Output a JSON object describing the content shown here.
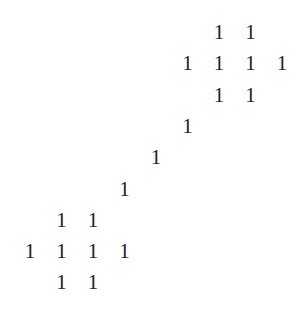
{
  "matrix": {
    "grid": {
      "cols": 9,
      "rows": 9,
      "x0": 30,
      "y0": 33,
      "dx": 31.5,
      "dy": 31.3
    },
    "text_color": "#222222",
    "entries": [
      {
        "row": 0,
        "col": 6,
        "value": "1"
      },
      {
        "row": 0,
        "col": 7,
        "value": "1"
      },
      {
        "row": 1,
        "col": 5,
        "value": "1"
      },
      {
        "row": 1,
        "col": 6,
        "value": "1"
      },
      {
        "row": 1,
        "col": 7,
        "value": "1"
      },
      {
        "row": 1,
        "col": 8,
        "value": "1"
      },
      {
        "row": 2,
        "col": 6,
        "value": "1"
      },
      {
        "row": 2,
        "col": 7,
        "value": "1"
      },
      {
        "row": 3,
        "col": 5,
        "value": "1"
      },
      {
        "row": 4,
        "col": 4,
        "value": "1"
      },
      {
        "row": 5,
        "col": 3,
        "value": "1"
      },
      {
        "row": 6,
        "col": 1,
        "value": "1"
      },
      {
        "row": 6,
        "col": 2,
        "value": "1"
      },
      {
        "row": 7,
        "col": 0,
        "value": "1"
      },
      {
        "row": 7,
        "col": 1,
        "value": "1"
      },
      {
        "row": 7,
        "col": 2,
        "value": "1"
      },
      {
        "row": 7,
        "col": 3,
        "value": "1"
      },
      {
        "row": 8,
        "col": 1,
        "value": "1"
      },
      {
        "row": 8,
        "col": 2,
        "value": "1"
      }
    ]
  }
}
